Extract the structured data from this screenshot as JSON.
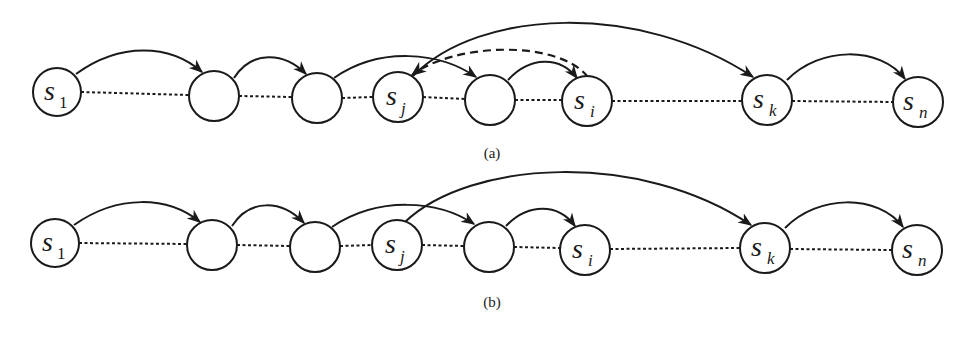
{
  "figure": {
    "panels": [
      {
        "id": "a",
        "caption": "(a)",
        "nodes": [
          {
            "id": "s1",
            "base": "s",
            "sub": "1",
            "cx": 57,
            "cy": 92
          },
          {
            "id": "n2",
            "base": "",
            "sub": "",
            "cx": 214,
            "cy": 96
          },
          {
            "id": "n3",
            "base": "",
            "sub": "",
            "cx": 317,
            "cy": 98
          },
          {
            "id": "sj",
            "base": "s",
            "sub": "j",
            "cx": 398,
            "cy": 97
          },
          {
            "id": "n5",
            "base": "",
            "sub": "",
            "cx": 490,
            "cy": 100
          },
          {
            "id": "si",
            "base": "s",
            "sub": "i",
            "cx": 587,
            "cy": 101
          },
          {
            "id": "sk",
            "base": "s",
            "sub": "k",
            "cx": 767,
            "cy": 100
          },
          {
            "id": "sn",
            "base": "s",
            "sub": "n",
            "cx": 918,
            "cy": 102
          }
        ],
        "dotted_links": [
          [
            "s1",
            "n2"
          ],
          [
            "n2",
            "n3"
          ],
          [
            "n3",
            "sj"
          ],
          [
            "sj",
            "n5"
          ],
          [
            "n5",
            "si"
          ],
          [
            "si",
            "sk"
          ],
          [
            "sk",
            "sn"
          ]
        ],
        "arcs": [
          {
            "from": "s1",
            "to": "n2",
            "style": "solid"
          },
          {
            "from": "n2",
            "to": "n3",
            "style": "solid"
          },
          {
            "from": "n3",
            "to": "n5",
            "style": "solid"
          },
          {
            "from": "n5",
            "to": "si",
            "style": "solid"
          },
          {
            "from": "sj",
            "to": "sk",
            "style": "solid"
          },
          {
            "from": "si",
            "to": "sj",
            "style": "dashed"
          },
          {
            "from": "sk",
            "to": "sn",
            "style": "solid"
          }
        ]
      },
      {
        "id": "b",
        "caption": "(b)",
        "nodes": [
          {
            "id": "s1",
            "base": "s",
            "sub": "1",
            "cx": 55,
            "cy": 243
          },
          {
            "id": "n2",
            "base": "",
            "sub": "",
            "cx": 212,
            "cy": 245
          },
          {
            "id": "n3",
            "base": "",
            "sub": "",
            "cx": 315,
            "cy": 247
          },
          {
            "id": "sj",
            "base": "s",
            "sub": "j",
            "cx": 397,
            "cy": 245
          },
          {
            "id": "n5",
            "base": "",
            "sub": "",
            "cx": 489,
            "cy": 247
          },
          {
            "id": "si",
            "base": "s",
            "sub": "i",
            "cx": 585,
            "cy": 250
          },
          {
            "id": "sk",
            "base": "s",
            "sub": "k",
            "cx": 765,
            "cy": 248
          },
          {
            "id": "sn",
            "base": "s",
            "sub": "n",
            "cx": 917,
            "cy": 250
          }
        ],
        "dotted_links": [
          [
            "s1",
            "n2"
          ],
          [
            "n2",
            "n3"
          ],
          [
            "n3",
            "sj"
          ],
          [
            "sj",
            "n5"
          ],
          [
            "n5",
            "si"
          ],
          [
            "si",
            "sk"
          ],
          [
            "sk",
            "sn"
          ]
        ],
        "arcs": [
          {
            "from": "s1",
            "to": "n2",
            "style": "solid"
          },
          {
            "from": "n2",
            "to": "n3",
            "style": "solid"
          },
          {
            "from": "n3",
            "to": "n5",
            "style": "solid"
          },
          {
            "from": "n5",
            "to": "si",
            "style": "solid"
          },
          {
            "from": "sj",
            "to": "sk",
            "style": "solid"
          },
          {
            "from": "sk",
            "to": "sn",
            "style": "solid"
          }
        ]
      }
    ],
    "labels": {
      "a": {
        "s1": "s",
        "s1_sub": "1",
        "sj": "s",
        "sj_sub": "j",
        "si": "s",
        "si_sub": "i",
        "sk": "s",
        "sk_sub": "k",
        "sn": "s",
        "sn_sub": "n",
        "caption": "(a)"
      },
      "b": {
        "s1": "s",
        "s1_sub": "1",
        "sj": "s",
        "sj_sub": "j",
        "si": "s",
        "si_sub": "i",
        "sk": "s",
        "sk_sub": "k",
        "sn": "s",
        "sn_sub": "n",
        "caption": "(b)"
      }
    }
  }
}
